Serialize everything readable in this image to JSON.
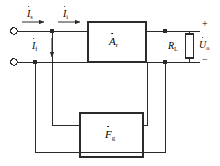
{
  "diagram": {
    "type": "circuit-block-diagram",
    "stroke_color": "#2b2b2b",
    "background_color": "#ffffff",
    "labels": {
      "input_source_current": {
        "symbol": "I",
        "subscript": "s",
        "dot": true
      },
      "amplifier_input_current": {
        "symbol": "I",
        "subscript": "i",
        "dot": true
      },
      "feedback_current": {
        "symbol": "I",
        "subscript": "f",
        "dot": true
      },
      "amplifier_gain": {
        "symbol": "A",
        "subscript": "r",
        "dot": true
      },
      "feedback_factor": {
        "symbol": "F",
        "subscript": "g",
        "dot": true
      },
      "load_resistor": {
        "symbol": "R",
        "subscript": "L",
        "dot": false
      },
      "output_voltage": {
        "symbol": "U",
        "subscript": "o",
        "dot": true
      },
      "polarity_positive": "+",
      "polarity_negative": "−"
    },
    "blocks": [
      {
        "name": "amplifier-block",
        "label_key": "amplifier_gain"
      },
      {
        "name": "feedback-block",
        "label_key": "feedback_factor"
      }
    ],
    "components": [
      {
        "name": "load-resistor",
        "label_key": "load_resistor"
      }
    ],
    "terminals": [
      {
        "name": "input-terminal-top",
        "style": "open-circle"
      },
      {
        "name": "input-terminal-bottom",
        "style": "open-circle"
      }
    ]
  }
}
